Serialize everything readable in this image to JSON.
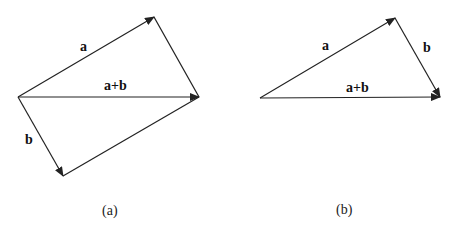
{
  "diagram_a": {
    "caption": "(a)",
    "labels": {
      "a": "a",
      "b": "b",
      "sum": "a+b"
    }
  },
  "diagram_b": {
    "caption": "(b)",
    "labels": {
      "a": "a",
      "b": "b",
      "sum": "a+b"
    }
  },
  "colors": {
    "stroke": "#222222",
    "background": "#ffffff"
  }
}
